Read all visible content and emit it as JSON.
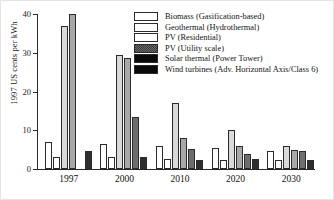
{
  "chart_data": {
    "type": "bar",
    "title": "",
    "xlabel": "",
    "ylabel": "1997 US cents per kWh",
    "categories": [
      "1997",
      "2000",
      "2010",
      "2020",
      "2030"
    ],
    "ylim": [
      0,
      40
    ],
    "yticks": [
      0,
      10,
      20,
      30,
      40
    ],
    "ytick_labels": [
      "0",
      "10",
      "20",
      "30",
      "40"
    ],
    "grid": false,
    "legend_position": "upper right",
    "series": [
      {
        "name": "Biomass (Gasification-based)",
        "swatch": "white",
        "color": "#ffffff",
        "values": [
          7.0,
          6.5,
          6.0,
          5.5,
          4.7
        ]
      },
      {
        "name": "Geothermal (Hydrothermal)",
        "swatch": "white",
        "color": "#ffffff",
        "values": [
          3.1,
          3.1,
          2.5,
          2.2,
          2.2
        ]
      },
      {
        "name": "PV (Residential)",
        "swatch": "white",
        "color": "#d9d9d9",
        "values": [
          36.8,
          29.5,
          17.0,
          10.0,
          6.0
        ]
      },
      {
        "name": "PV (Utility scale)",
        "swatch": "dark-dither",
        "color": "#a8a8a8",
        "values": [
          40.0,
          28.6,
          8.0,
          6.0,
          5.0
        ]
      },
      {
        "name": "Solar thermal (Power Tower)",
        "swatch": "black",
        "color": "#6e6e6e",
        "values": [
          0,
          13.5,
          5.2,
          4.0,
          4.6
        ]
      },
      {
        "name": "Wind turbines (Adv. Horizontal Axis/Class 6)",
        "swatch": "black",
        "color": "#2e2e2e",
        "values": [
          4.7,
          3.0,
          2.3,
          2.6,
          2.4
        ]
      }
    ]
  }
}
